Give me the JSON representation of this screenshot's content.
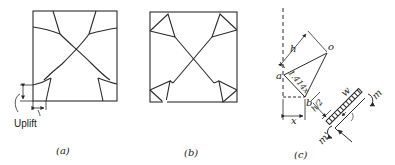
{
  "figure": {
    "panels": [
      {
        "id": "a",
        "caption": "(a)",
        "annotation": "Uplift"
      },
      {
        "id": "b",
        "caption": "(b)"
      },
      {
        "id": "c",
        "caption": "(c)",
        "labels": {
          "h": "h",
          "o": "o",
          "a": "a",
          "b": "b",
          "diag": "1.414x",
          "x": "x",
          "h_over_2": "h/2",
          "w": "w",
          "m": "m",
          "m_prime": "m'"
        }
      }
    ],
    "colors": {
      "line": "#2a2a2a",
      "background": "#ffffff"
    }
  }
}
